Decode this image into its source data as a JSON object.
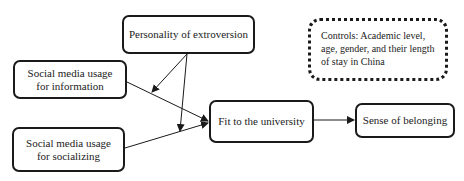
{
  "nodes": {
    "extroversion": {
      "label": "Personality of extroversion"
    },
    "info": {
      "label": "Social media usage for information",
      "line1": "Social media usage",
      "line2": "for information"
    },
    "socializing": {
      "label": "Social media usage for socializing",
      "line1": "Social media usage",
      "line2": "for socializing"
    },
    "fit": {
      "label": "Fit to the university"
    },
    "belonging": {
      "label": "Sense of belonging"
    }
  },
  "controls": {
    "text": "Controls: Academic level, age, gender, and their length of stay in China"
  },
  "edges": [
    {
      "from": "info",
      "to": "fit"
    },
    {
      "from": "socializing",
      "to": "fit"
    },
    {
      "from": "fit",
      "to": "belonging"
    },
    {
      "from": "extroversion",
      "to": "info->fit",
      "type": "moderation"
    },
    {
      "from": "extroversion",
      "to": "socializing->fit",
      "type": "moderation"
    }
  ],
  "colors": {
    "stroke": "#1a1a1a",
    "text": "#222222",
    "background": "#ffffff"
  }
}
